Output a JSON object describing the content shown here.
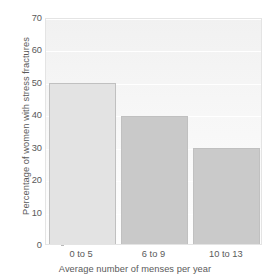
{
  "chart_data": {
    "type": "bar",
    "title": "",
    "categories": [
      "0 to 5",
      "6 to 9",
      "10 to 13"
    ],
    "values": [
      49.5,
      39.5,
      29.5
    ],
    "xlabel": "Average number of menses per year",
    "ylabel": "Percentage of women with stress fractures",
    "ylim": [
      0,
      70
    ],
    "yticks": [
      0,
      10,
      20,
      30,
      40,
      50,
      60,
      70
    ],
    "ytick_labels": [
      "0",
      "10",
      "20",
      "30",
      "40",
      "50",
      "60",
      "70"
    ],
    "grid": true,
    "legend": false,
    "bar_colors": [
      "#e3e3e3",
      "#c9c9c9",
      "#cacaca"
    ],
    "bar_edge_color": "#c0c0c0",
    "plot_bg_color": "#f6f6f6",
    "gridline_color": "#ffffff",
    "text_color": "#5a5a5a"
  }
}
